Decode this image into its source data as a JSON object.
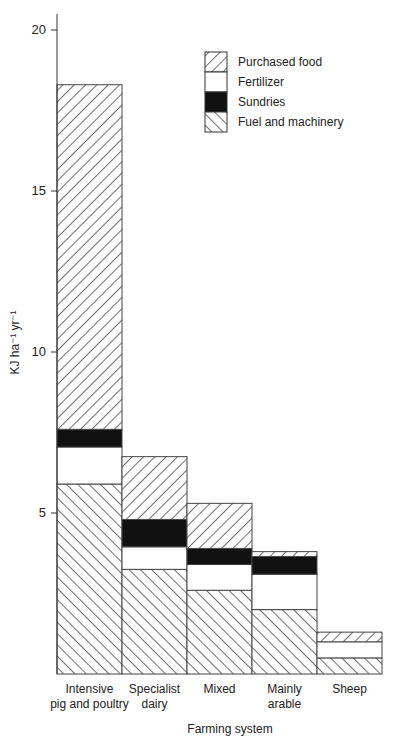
{
  "chart_data": {
    "type": "bar",
    "stacked": true,
    "title": "",
    "xlabel": "Farming system",
    "ylabel": "KJ ha⁻¹ yr⁻¹",
    "ylim": [
      0,
      20
    ],
    "yticks": [
      5,
      10,
      15,
      20
    ],
    "categories": [
      "Intensive pig and poultry",
      "Specialist dairy",
      "Mixed",
      "Mainly arable",
      "Sheep"
    ],
    "category_lines": [
      [
        "Intensive",
        "pig and poultry"
      ],
      [
        "Specialist",
        "dairy"
      ],
      [
        "Mixed",
        ""
      ],
      [
        "Mainly",
        "arable"
      ],
      [
        "Sheep",
        ""
      ]
    ],
    "series": [
      {
        "name": "Fuel and machinery",
        "pattern": "hatch-forward",
        "values": [
          5.9,
          3.25,
          2.6,
          2.0,
          0.5
        ]
      },
      {
        "name": "Fertilizer",
        "pattern": "white",
        "values": [
          1.15,
          0.7,
          0.8,
          1.1,
          0.5
        ]
      },
      {
        "name": "Sundries",
        "pattern": "black",
        "values": [
          0.55,
          0.85,
          0.5,
          0.55,
          0.0
        ]
      },
      {
        "name": "Purchased food",
        "pattern": "hatch-back",
        "values": [
          10.7,
          1.95,
          1.4,
          0.15,
          0.3
        ]
      }
    ],
    "totals": [
      18.3,
      6.75,
      5.3,
      3.8,
      1.3
    ],
    "legend_order": [
      "Purchased food",
      "Fertilizer",
      "Sundries",
      "Fuel and machinery"
    ],
    "legend_position": "upper right",
    "grid": false
  }
}
